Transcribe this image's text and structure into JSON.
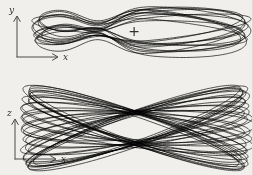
{
  "figure": {
    "background": "#f0efeb",
    "stroke_color": "#272727",
    "axis_color": "#4a4a4a",
    "label_color": "#333333"
  },
  "chart_data": {
    "type": "line",
    "title": "",
    "views": [
      {
        "id": "top",
        "axis_horizontal": "x",
        "axis_vertical": "y",
        "center": [
          141,
          30
        ],
        "strands": 12,
        "semi_major": [
          101,
          110
        ],
        "semi_minor": [
          9,
          24
        ],
        "tilt_max_deg": 6,
        "pinch": {
          "x": 96,
          "strength": 0.8,
          "width": 27
        },
        "marker": {
          "symbol": "+",
          "x": 134,
          "y": 31
        }
      },
      {
        "id": "bottom",
        "axis_horizontal": "x",
        "axis_vertical": "z",
        "center": [
          136,
          128
        ],
        "strands": 30,
        "semi_major": [
          110,
          118
        ],
        "semi_minor": [
          13,
          17
        ],
        "tilt_max_deg": 20,
        "pinch": null,
        "marker": null
      }
    ],
    "legend": null,
    "grid": false
  }
}
